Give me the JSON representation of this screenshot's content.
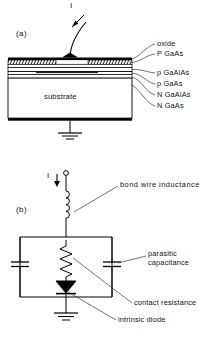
{
  "figure": {
    "panel_a": {
      "tag": "(a)",
      "current_label": "I",
      "body_label": "substrate",
      "layer_labels": [
        "oxide",
        "P GaAs",
        "p GaAlAs",
        "p GaAs",
        "N GaAlAs",
        "N GaAs"
      ]
    },
    "panel_b": {
      "tag": "(b)",
      "current_label": "I",
      "annotations": [
        "bond wire inductance",
        "parasitic",
        "capacitance",
        "contact resistance",
        "intrinsic diode"
      ],
      "inductance_label": "bond wire inductance",
      "capacitance_label_line1": "parasitic",
      "capacitance_label_line2": "capacitance",
      "resistance_label": "contact resistance",
      "diode_label": "intrinsic diode"
    }
  },
  "colors": {
    "ink": "#000000",
    "background": "#ffffff",
    "leader": "#333333"
  }
}
